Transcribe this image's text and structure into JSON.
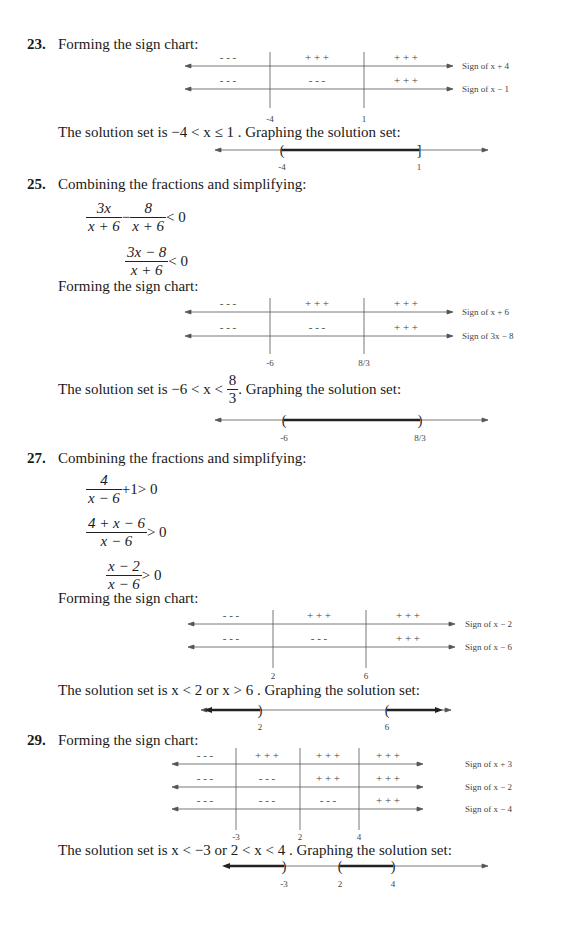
{
  "problems": [
    {
      "number": "23",
      "intro": "Forming the sign chart:",
      "sign_chart": {
        "critical_points": [
          "-4",
          "1"
        ],
        "rows": [
          {
            "label": "Sign of x + 4",
            "signs": [
              "- - -",
              "+ + +",
              "+ + +"
            ]
          },
          {
            "label": "Sign of x − 1",
            "signs": [
              "- - -",
              "- - -",
              "+ + +"
            ]
          }
        ]
      },
      "solution_text": "The solution set is −4 < x ≤ 1 . Graphing the solution set:",
      "solution_graph": {
        "ticks": [
          "-4",
          "1"
        ],
        "intervals": [
          {
            "from": "-4",
            "to": "1",
            "left": "(",
            "right": "]"
          }
        ]
      }
    },
    {
      "number": "25",
      "intro": "Combining the fractions and simplifying:",
      "steps": [
        {
          "parts": [
            {
              "num": "3x",
              "den": "x + 6"
            },
            {
              "op": "−"
            },
            {
              "num": "8",
              "den": "x + 6"
            }
          ],
          "rel": "< 0"
        },
        {
          "parts": [
            {
              "num": "3x − 8",
              "den": "x + 6"
            }
          ],
          "rel": "< 0"
        }
      ],
      "chart_intro": "Forming the sign chart:",
      "sign_chart": {
        "critical_points": [
          "-6",
          "8/3"
        ],
        "rows": [
          {
            "label": "Sign of x + 6",
            "signs": [
              "- - -",
              "+ + +",
              "+ + +"
            ]
          },
          {
            "label": "Sign of 3x − 8",
            "signs": [
              "- - -",
              "- - -",
              "+ + +"
            ]
          }
        ]
      },
      "solution_prefix": "The solution set is −6 < x <",
      "solution_frac": {
        "num": "8",
        "den": "3"
      },
      "solution_suffix": ". Graphing the solution set:",
      "solution_graph": {
        "ticks": [
          "-6",
          "8/3"
        ],
        "intervals": [
          {
            "from": "-6",
            "to": "8/3",
            "left": "(",
            "right": ")"
          }
        ]
      }
    },
    {
      "number": "27",
      "intro": "Combining the fractions and simplifying:",
      "steps": [
        {
          "parts": [
            {
              "num": "4",
              "den": "x − 6"
            },
            {
              "op": "+1"
            }
          ],
          "rel": "> 0"
        },
        {
          "parts": [
            {
              "num": "4 + x − 6",
              "den": "x − 6"
            }
          ],
          "rel": "> 0"
        },
        {
          "parts": [
            {
              "num": "x − 2",
              "den": "x − 6"
            }
          ],
          "rel": "> 0"
        }
      ],
      "chart_intro": "Forming the sign chart:",
      "sign_chart": {
        "critical_points": [
          "2",
          "6"
        ],
        "rows": [
          {
            "label": "Sign of x − 2",
            "signs": [
              "- - -",
              "+ + +",
              "+ + +"
            ]
          },
          {
            "label": "Sign of x − 6",
            "signs": [
              "- - -",
              "- - -",
              "+ + +"
            ]
          }
        ]
      },
      "solution_text": "The solution set is x < 2 or x > 6 . Graphing the solution set:",
      "solution_graph": {
        "ticks": [
          "2",
          "6"
        ],
        "intervals": [
          {
            "from": "-inf",
            "to": "2",
            "right": ")"
          },
          {
            "from": "6",
            "to": "inf",
            "left": "("
          }
        ]
      }
    },
    {
      "number": "29",
      "intro": "Forming the sign chart:",
      "sign_chart": {
        "critical_points": [
          "-3",
          "2",
          "4"
        ],
        "rows": [
          {
            "label": "Sign of x + 3",
            "signs": [
              "- - -",
              "+ + +",
              "+ + +",
              "+ + +"
            ]
          },
          {
            "label": "Sign of x − 2",
            "signs": [
              "- - -",
              "- - -",
              "+ + +",
              "+ + +"
            ]
          },
          {
            "label": "Sign of x − 4",
            "signs": [
              "- - -",
              "- - -",
              "- - -",
              "+ + +"
            ]
          }
        ]
      },
      "solution_text": "The solution set is x < −3 or 2 < x < 4 . Graphing the solution set:",
      "solution_graph": {
        "ticks": [
          "-3",
          "2",
          "4"
        ],
        "intervals": [
          {
            "from": "-inf",
            "to": "-3",
            "right": ")"
          },
          {
            "from": "2",
            "to": "4",
            "left": "(",
            "right": ")"
          }
        ]
      }
    }
  ]
}
